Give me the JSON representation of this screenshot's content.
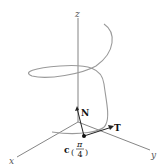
{
  "figure": {
    "axes": {
      "x_label": "x",
      "y_label": "y",
      "z_label": "z"
    },
    "vectors": {
      "normal_label": "N",
      "tangent_label": "T"
    },
    "point": {
      "func": "c",
      "arg_num": "π",
      "arg_den": "4"
    },
    "colors": {
      "axis": "#777777",
      "helix": "#9a9a9a",
      "vector": "#222222"
    }
  }
}
